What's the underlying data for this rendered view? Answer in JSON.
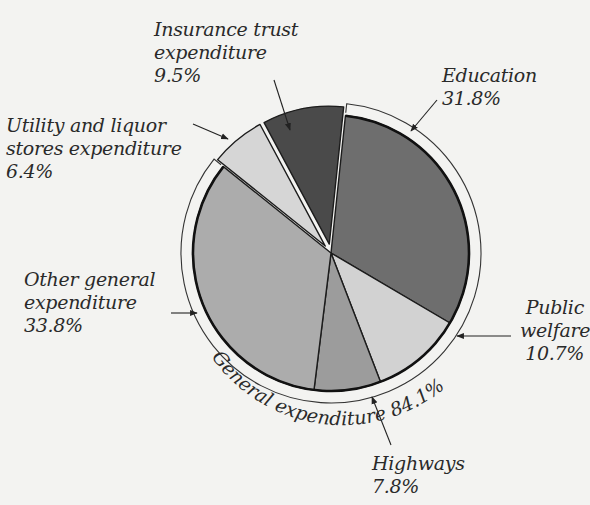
{
  "chart_data": {
    "type": "pie",
    "title": "",
    "slices": [
      {
        "label": "Education",
        "value": 31.8,
        "color": "#6e6e6e",
        "group": "General expenditure"
      },
      {
        "label": "Public welfare",
        "value": 10.7,
        "color": "#d2d2d2",
        "group": "General expenditure"
      },
      {
        "label": "Highways",
        "value": 7.8,
        "color": "#9c9c9c",
        "group": "General expenditure"
      },
      {
        "label": "Other general expenditure",
        "value": 33.8,
        "color": "#acacac",
        "group": "General expenditure"
      },
      {
        "label": "Utility and liquor stores expenditure",
        "value": 6.4,
        "color": "#d6d6d6",
        "group": null,
        "exploded": true
      },
      {
        "label": "Insurance trust expenditure",
        "value": 9.5,
        "color": "#4a4a4a",
        "group": null,
        "exploded": true
      }
    ],
    "groups": [
      {
        "label": "General expenditure",
        "value": 84.1,
        "arc_label": "General expenditure 84.1%"
      }
    ],
    "background": "#f3f3f1"
  },
  "labels": {
    "insurance": {
      "line1": "Insurance trust",
      "line2": "expenditure",
      "pct": "9.5%"
    },
    "utility": {
      "line1": "Utility and liquor",
      "line2": "stores expenditure",
      "pct": "6.4%"
    },
    "education": {
      "line1": "Education",
      "pct": "31.8%"
    },
    "other": {
      "line1": "Other general",
      "line2": "expenditure",
      "pct": "33.8%"
    },
    "welfare": {
      "line1": "Public",
      "line2": "welfare",
      "pct": "10.7%"
    },
    "highways": {
      "line1": "Highways",
      "pct": "7.8%"
    },
    "general_arc": "General expenditure 84.1%"
  }
}
